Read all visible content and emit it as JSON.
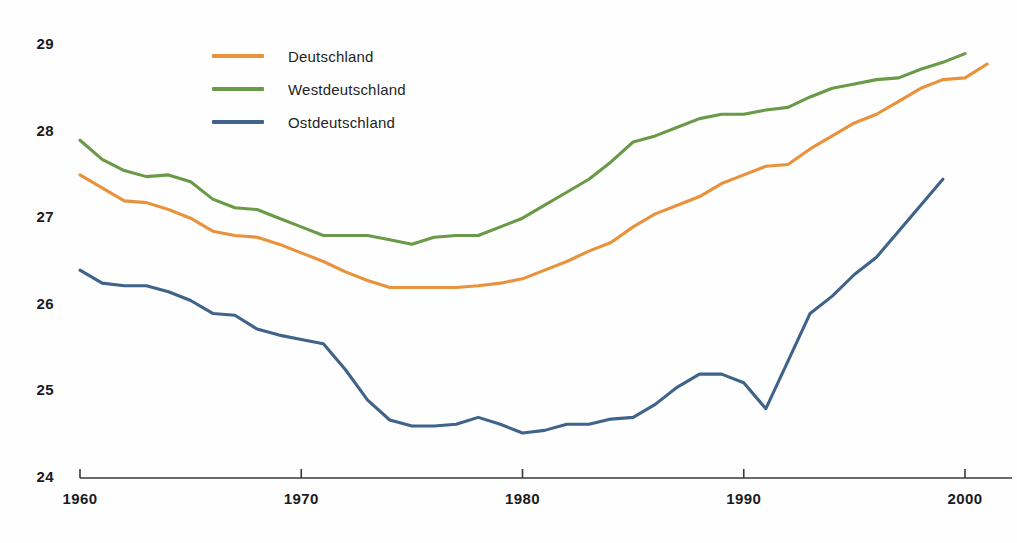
{
  "chart_data": {
    "type": "line",
    "title": "",
    "subtitle": "",
    "xlabel": "",
    "ylabel": "",
    "xlim": [
      1960,
      2001
    ],
    "ylim": [
      24,
      29.35
    ],
    "grid": false,
    "legend_position": "top-left",
    "x_ticks": [
      1960,
      1970,
      1980,
      1990,
      2000
    ],
    "x_tick_labels": [
      "1960",
      "1970",
      "1980",
      "1990",
      "2000"
    ],
    "y_ticks": [
      24,
      25,
      26,
      27,
      28,
      29
    ],
    "y_tick_labels": [
      "24",
      "25",
      "26",
      "27",
      "28",
      "29"
    ],
    "series": [
      {
        "name": "Deutschland",
        "color": "#E8923C",
        "x": [
          1960,
          1961,
          1962,
          1963,
          1964,
          1965,
          1966,
          1967,
          1968,
          1969,
          1970,
          1971,
          1972,
          1973,
          1974,
          1975,
          1976,
          1977,
          1978,
          1979,
          1980,
          1981,
          1982,
          1983,
          1984,
          1985,
          1986,
          1987,
          1988,
          1989,
          1990,
          1991,
          1992,
          1993,
          1994,
          1995,
          1996,
          1997,
          1998,
          1999,
          2000
        ],
        "values": [
          27.5,
          27.35,
          27.2,
          27.18,
          27.1,
          27.0,
          26.85,
          26.8,
          26.78,
          26.7,
          26.6,
          26.5,
          26.38,
          26.28,
          26.2,
          26.2,
          26.2,
          26.2,
          26.22,
          26.25,
          26.3,
          26.4,
          26.5,
          26.62,
          26.72,
          26.9,
          27.05,
          27.15,
          27.25,
          27.4,
          27.5,
          27.6,
          27.62,
          27.8,
          27.95,
          28.1,
          28.2,
          28.35,
          28.5,
          28.6,
          28.62
        ],
        "last_x": 2001,
        "last_value": 28.78
      },
      {
        "name": "Westdeutschland",
        "color": "#6A9A48",
        "x": [
          1960,
          1961,
          1962,
          1963,
          1964,
          1965,
          1966,
          1967,
          1968,
          1969,
          1970,
          1971,
          1972,
          1973,
          1974,
          1975,
          1976,
          1977,
          1978,
          1979,
          1980,
          1981,
          1982,
          1983,
          1984,
          1985,
          1986,
          1987,
          1988,
          1989,
          1990,
          1991,
          1992,
          1993,
          1994,
          1995,
          1996,
          1997,
          1998,
          1999,
          2000
        ],
        "values": [
          27.9,
          27.68,
          27.55,
          27.48,
          27.5,
          27.42,
          27.22,
          27.12,
          27.1,
          27.0,
          26.9,
          26.8,
          26.8,
          26.8,
          26.75,
          26.7,
          26.78,
          26.8,
          26.8,
          26.9,
          27.0,
          27.15,
          27.3,
          27.45,
          27.65,
          27.88,
          27.95,
          28.05,
          28.15,
          28.2,
          28.2,
          28.25,
          28.28,
          28.4,
          28.5,
          28.55,
          28.6,
          28.62,
          28.72,
          28.8,
          28.9
        ],
        "last_x": 2000,
        "last_value": 28.9
      },
      {
        "name": "Ostdeutschland",
        "color": "#3F6389",
        "x": [
          1960,
          1961,
          1962,
          1963,
          1964,
          1965,
          1966,
          1967,
          1968,
          1969,
          1970,
          1971,
          1972,
          1973,
          1974,
          1975,
          1976,
          1977,
          1978,
          1979,
          1980,
          1981,
          1982,
          1983,
          1984,
          1985,
          1986,
          1987,
          1988,
          1989,
          1990,
          1991,
          1992,
          1993,
          1994,
          1995,
          1996,
          1997,
          1998,
          1999
        ],
        "values": [
          26.4,
          26.25,
          26.22,
          26.22,
          26.15,
          26.05,
          25.9,
          25.88,
          25.72,
          25.65,
          25.6,
          25.55,
          25.25,
          24.9,
          24.67,
          24.6,
          24.6,
          24.62,
          24.7,
          24.62,
          24.52,
          24.55,
          24.62,
          24.62,
          24.68,
          24.7,
          24.85,
          25.05,
          25.2,
          25.2,
          25.1,
          24.8,
          25.35,
          25.9,
          26.1,
          26.35,
          26.55,
          26.85,
          27.15,
          27.45
        ],
        "last_x": 1999,
        "last_value": 27.45
      }
    ]
  },
  "legend": {
    "items": [
      {
        "label": "Deutschland",
        "color": "#E8923C"
      },
      {
        "label": "Westdeutschland",
        "color": "#6A9A48"
      },
      {
        "label": "Ostdeutschland",
        "color": "#3F6389"
      }
    ]
  },
  "axes": {
    "axis_color": "#3a3a3a"
  }
}
